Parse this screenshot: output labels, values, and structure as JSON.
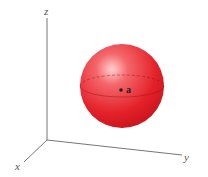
{
  "figure": {
    "type": "3d-sphere-diagram",
    "axes": {
      "x_label": "x",
      "y_label": "y",
      "z_label": "z"
    },
    "sphere": {
      "color": "#e8202a",
      "center_label": "a"
    }
  }
}
